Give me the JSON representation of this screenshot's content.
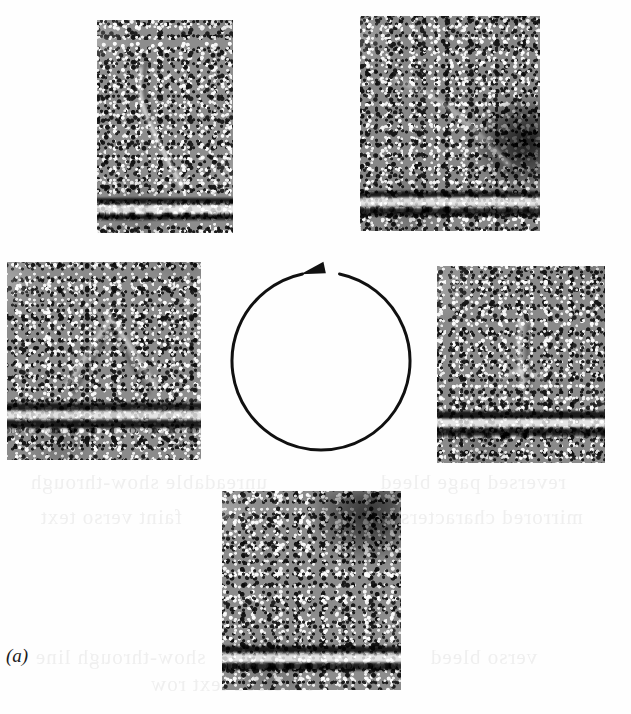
{
  "figure": {
    "label": "(a)",
    "label_style": "italic-serif",
    "width": 631,
    "height": 714,
    "background_color": "#ffffff",
    "ink_color": "#111111"
  },
  "cycle_arrow": {
    "name": "clockwise-cycle-arrow",
    "direction": "clockwise",
    "center_x": 321,
    "center_y": 361,
    "radius": 89,
    "stroke_width": 3,
    "stroke_color": "#111111",
    "gap_start_deg": -78,
    "gap_end_deg": -102,
    "arrowhead_tip_x": 313,
    "arrowhead_tip_y": 272
  },
  "panels": [
    {
      "id": "panel-top-left",
      "name": "micrograph-top-left",
      "position": "top-left",
      "x": 97,
      "y": 20,
      "width": 136,
      "height": 213,
      "membrane_band_top_pct": 82,
      "base_gray": "#8c8c8c",
      "features": "diagonal filament arc descending from upper-middle toward the membrane; bright lipid bilayer band across the lower edge"
    },
    {
      "id": "panel-top-right",
      "name": "micrograph-top-right",
      "position": "top-right",
      "x": 360,
      "y": 16,
      "width": 180,
      "height": 215,
      "membrane_band_top_pct": 80,
      "base_gray": "#878787",
      "features": "broad diffuse density in the middle with a dark blotch at the right edge; bright bilayer band across the lower portion"
    },
    {
      "id": "panel-left",
      "name": "micrograph-left",
      "position": "left",
      "x": 7,
      "y": 262,
      "width": 194,
      "height": 198,
      "membrane_band_top_pct": 70,
      "base_gray": "#8a8a8a",
      "features": "triangular budding density above a strongly contrasted dark-bright-dark bilayer band"
    },
    {
      "id": "panel-right",
      "name": "micrograph-right",
      "position": "right",
      "x": 437,
      "y": 266,
      "width": 168,
      "height": 197,
      "membrane_band_top_pct": 72,
      "base_gray": "#898989",
      "features": "vertical stalk-like density meeting the bilayer band in the lower third"
    },
    {
      "id": "panel-bottom",
      "name": "micrograph-bottom",
      "position": "bottom",
      "x": 222,
      "y": 491,
      "width": 179,
      "height": 199,
      "membrane_band_top_pct": 76,
      "base_gray": "#8b8b8b",
      "features": "dark region at upper right; flattened membrane band with bright speckles near the lower edge"
    }
  ],
  "ghost_text": {
    "note": "faint scanner show-through from the reverse page side",
    "color": "#ededed",
    "lines": [
      {
        "text": "unreadable show-through",
        "x": 30,
        "y": 470
      },
      {
        "text": "reversed page bleed",
        "x": 380,
        "y": 470
      },
      {
        "text": "faint verso text",
        "x": 40,
        "y": 505
      },
      {
        "text": "mirrored characters",
        "x": 400,
        "y": 505
      },
      {
        "text": "show-through line",
        "x": 35,
        "y": 645
      },
      {
        "text": "verso bleed",
        "x": 430,
        "y": 645
      },
      {
        "text": "reversed text row",
        "x": 150,
        "y": 672
      }
    ]
  }
}
